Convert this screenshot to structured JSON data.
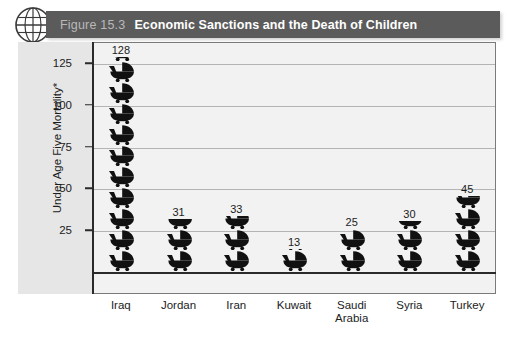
{
  "figure": {
    "number": "Figure 15.3",
    "title": "Economic Sanctions and the Death of Children",
    "globe_icon": "globe-icon"
  },
  "chart_data": {
    "type": "bar",
    "title": "Economic Sanctions and the Death of Children",
    "xlabel": "",
    "ylabel": "Under Age Five Mortality*",
    "categories": [
      "Iraq",
      "Jordan",
      "Iran",
      "Kuwait",
      "Saudi Arabia",
      "Syria",
      "Turkey"
    ],
    "values": [
      128,
      31,
      33,
      13,
      25,
      30,
      45
    ],
    "value_labels": [
      "128",
      "31",
      "33",
      "13",
      "25",
      "30",
      "45"
    ],
    "ylim": [
      0,
      135
    ],
    "yticks": [
      25,
      50,
      75,
      100,
      125
    ],
    "ytick_labels": [
      "25",
      "50",
      "75",
      "100",
      "125"
    ],
    "grid": true,
    "legend": "none",
    "marker_glyph": "baby-pram-pictogram",
    "series_color": "#111111"
  },
  "colors": {
    "title_band": "#5b5b5b",
    "title_text": "#ffffff",
    "figure_number_text": "#b9b9b9",
    "plot_background": "#f2f2f2",
    "side_panel": "#e6e6e6",
    "gridline": "#b4b4b4",
    "axis": "#2a2a2a",
    "bar": "#111111"
  }
}
